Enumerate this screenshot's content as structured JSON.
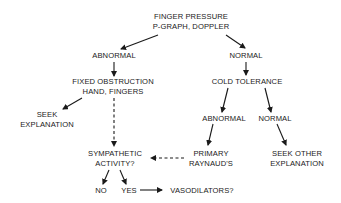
{
  "nodes": {
    "root_line1": "FINGER PRESSURE",
    "root_line2": "P-GRAPH, DOPPLER",
    "abnormal": "ABNORMAL",
    "normal": "NORMAL",
    "fixed_line1": "FIXED OBSTRUCTION",
    "fixed_line2": "HAND, FINGERS",
    "cold": "COLD TOLERANCE",
    "seek_line1": "SEEK",
    "seek_line2": "EXPLANATION",
    "abnormal2": "ABNORMAL",
    "normal2": "NORMAL",
    "symp_line1": "SYMPATHETIC",
    "symp_line2": "ACTIVITY?",
    "primary_line1": "PRIMARY",
    "primary_line2": "RAYNAUD'S",
    "seekother_line1": "SEEK OTHER",
    "seekother_line2": "EXPLANATION",
    "no": "NO",
    "yes": "YES",
    "vaso": "VASODILATORS?"
  }
}
